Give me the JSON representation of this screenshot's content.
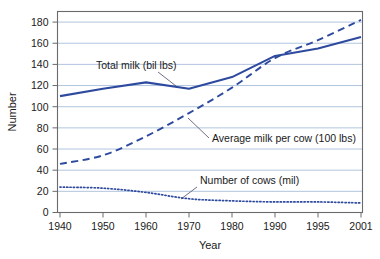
{
  "chart_data": {
    "type": "line",
    "title": "",
    "xlabel": "Year",
    "ylabel": "Number",
    "xlim": [
      1940,
      2001
    ],
    "ylim": [
      0,
      190
    ],
    "grid": true,
    "legend_position": "inline-annotations",
    "x_tick_labels": [
      "1940",
      "1950",
      "1960",
      "1970",
      "1980",
      "1990",
      "1995",
      "2001"
    ],
    "x_tick_values": [
      1940,
      1950,
      1960,
      1970,
      1980,
      1990,
      1995,
      2001
    ],
    "y_tick_labels": [
      "0",
      "20",
      "40",
      "60",
      "80",
      "100",
      "120",
      "140",
      "160",
      "180"
    ],
    "y_tick_values": [
      0,
      20,
      40,
      60,
      80,
      100,
      120,
      140,
      160,
      180
    ],
    "x": [
      1940,
      1950,
      1960,
      1970,
      1980,
      1990,
      1995,
      2001
    ],
    "series": [
      {
        "name": "Total milk (bil lbs)",
        "style": "solid",
        "color": "#2E4A9E",
        "values": [
          110,
          117,
          123,
          117,
          128,
          148,
          155,
          166
        ]
      },
      {
        "name": "Average milk per cow (100 lbs)",
        "style": "dashed",
        "color": "#2E4A9E",
        "values": [
          46,
          54,
          72,
          94,
          118,
          146,
          163,
          182
        ]
      },
      {
        "name": "Number of cows (mil)",
        "style": "dotted",
        "color": "#2E4A9E",
        "values": [
          24,
          23,
          19,
          13,
          11,
          10,
          10,
          9
        ]
      }
    ],
    "annotations": [
      {
        "text": "Total milk (bil lbs)",
        "name": "annotation-total-milk",
        "text_x": 96,
        "text_y": 69,
        "leader": [
          [
            158,
            72
          ],
          [
            176,
            86
          ]
        ]
      },
      {
        "text": "Average milk per cow (100 lbs)",
        "name": "annotation-avg-milk-per-cow",
        "text_x": 212,
        "text_y": 142,
        "leader": [
          [
            209,
            138
          ],
          [
            188,
            118
          ]
        ]
      },
      {
        "text": "Number of cows (mil)",
        "name": "annotation-number-of-cows",
        "text_x": 200,
        "text_y": 184,
        "leader": [
          [
            197,
            187
          ],
          [
            181,
            199
          ]
        ]
      }
    ],
    "colors": {
      "line": "#2E4A9E",
      "grid": "#A8BEDA",
      "frame": "#6A6A6A",
      "text": "#1A1A1A",
      "background": "#FFFFFF"
    }
  }
}
